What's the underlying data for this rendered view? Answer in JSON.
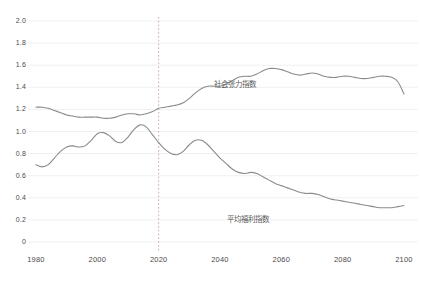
{
  "chart_data": {
    "type": "line",
    "title": "",
    "xlabel": "",
    "ylabel": "",
    "xlim": [
      1980,
      2100
    ],
    "ylim": [
      0,
      2.0
    ],
    "grid": true,
    "legend_position": "inline-annotation",
    "xticks": [
      "1980",
      "2000",
      "2020",
      "2040",
      "2060",
      "2080",
      "2100"
    ],
    "xtick_values": [
      1980,
      2000,
      2020,
      2040,
      2060,
      2080,
      2100
    ],
    "yticks": [
      "0",
      "0.2",
      "0.4",
      "0.6",
      "0.8",
      "1.0",
      "1.2",
      "1.4",
      "1.6",
      "1.8",
      "2.0"
    ],
    "ytick_values": [
      0,
      0.2,
      0.4,
      0.6,
      0.8,
      1.0,
      1.2,
      1.4,
      1.6,
      1.8,
      2.0
    ],
    "annotations": [
      {
        "name": "divider",
        "type": "vline",
        "x": 2020,
        "style": "dotted",
        "color": "#c8a0a0"
      }
    ],
    "x": [
      1980,
      1982,
      1984,
      1986,
      1988,
      1990,
      1992,
      1994,
      1996,
      1998,
      2000,
      2002,
      2004,
      2006,
      2008,
      2010,
      2012,
      2014,
      2016,
      2018,
      2020,
      2022,
      2024,
      2026,
      2028,
      2030,
      2032,
      2034,
      2036,
      2038,
      2040,
      2042,
      2044,
      2046,
      2048,
      2050,
      2052,
      2054,
      2056,
      2058,
      2060,
      2062,
      2064,
      2066,
      2068,
      2070,
      2072,
      2074,
      2076,
      2078,
      2080,
      2082,
      2084,
      2086,
      2088,
      2090,
      2092,
      2094,
      2096,
      2098,
      2100
    ],
    "series": [
      {
        "name": "社会张力指数",
        "color": "#8a8a8a",
        "label_x": 2046,
        "label_y": 1.44,
        "values": [
          1.22,
          1.22,
          1.21,
          1.19,
          1.17,
          1.15,
          1.14,
          1.13,
          1.13,
          1.13,
          1.13,
          1.12,
          1.12,
          1.13,
          1.15,
          1.16,
          1.16,
          1.15,
          1.16,
          1.18,
          1.21,
          1.22,
          1.23,
          1.24,
          1.26,
          1.3,
          1.35,
          1.39,
          1.41,
          1.41,
          1.41,
          1.43,
          1.46,
          1.49,
          1.5,
          1.5,
          1.52,
          1.55,
          1.57,
          1.57,
          1.56,
          1.54,
          1.52,
          1.51,
          1.52,
          1.53,
          1.52,
          1.5,
          1.49,
          1.49,
          1.5,
          1.5,
          1.49,
          1.48,
          1.48,
          1.49,
          1.5,
          1.5,
          1.49,
          1.45,
          1.34
        ]
      },
      {
        "name": "平均福利指数",
        "color": "#8a8a8a",
        "label_x": 2050,
        "label_y": 0.22,
        "values": [
          0.7,
          0.68,
          0.7,
          0.76,
          0.82,
          0.86,
          0.87,
          0.86,
          0.87,
          0.92,
          0.98,
          0.99,
          0.96,
          0.91,
          0.9,
          0.95,
          1.02,
          1.06,
          1.04,
          0.97,
          0.9,
          0.84,
          0.8,
          0.79,
          0.82,
          0.88,
          0.92,
          0.92,
          0.88,
          0.82,
          0.76,
          0.71,
          0.66,
          0.63,
          0.62,
          0.63,
          0.62,
          0.59,
          0.56,
          0.53,
          0.51,
          0.49,
          0.47,
          0.45,
          0.44,
          0.44,
          0.43,
          0.41,
          0.39,
          0.38,
          0.37,
          0.36,
          0.35,
          0.34,
          0.33,
          0.32,
          0.31,
          0.31,
          0.31,
          0.32,
          0.33
        ]
      }
    ]
  }
}
